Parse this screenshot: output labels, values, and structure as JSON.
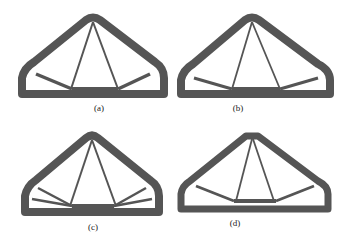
{
  "figure": {
    "panels": [
      {
        "id": "a",
        "label": "(a)",
        "description": "Topology-optimized arch truss with two inner diagonal members and one side strut each side"
      },
      {
        "id": "b",
        "label": "(b)",
        "description": "Topology-optimized arch truss, variant with thinner diagonals"
      },
      {
        "id": "c",
        "label": "(c)",
        "description": "Topology-optimized arch truss with two side struts per side"
      },
      {
        "id": "d",
        "label": "(d)",
        "description": "Topology-optimized truss with flat top and polygonal lower chord"
      }
    ],
    "colors": {
      "material": "#555555",
      "background": "#ffffff"
    }
  }
}
